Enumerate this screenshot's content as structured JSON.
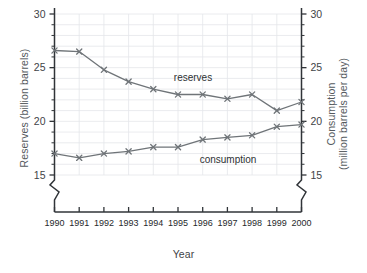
{
  "chart_data": {
    "type": "line",
    "title": "",
    "xlabel": "Year",
    "ylabel": "Reserves (billion barrels)",
    "ylabel_right_line1": "Consumption",
    "ylabel_right_line2": "(million barrels per day)",
    "categories": [
      "1990",
      "1991",
      "1992",
      "1993",
      "1994",
      "1995",
      "1996",
      "1997",
      "1998",
      "1999",
      "2000"
    ],
    "x": [
      1990,
      1991,
      1992,
      1993,
      1994,
      1995,
      1996,
      1997,
      1998,
      1999,
      2000
    ],
    "ylim": [
      15,
      30
    ],
    "ylim_right": [
      15,
      30
    ],
    "yticks": [
      15,
      20,
      25,
      30
    ],
    "yticks_right": [
      15,
      20,
      25,
      30
    ],
    "ytick_labels": [
      "15",
      "20",
      "25",
      "30"
    ],
    "ytick_labels_right": [
      "15",
      "20",
      "25",
      "30"
    ],
    "minor_tick_step": 1,
    "axis_break": true,
    "grid": true,
    "legend": "inline-annotations",
    "series": [
      {
        "name": "reserves",
        "axis": "left",
        "units": "billion barrels",
        "color": "#6f7478",
        "marker": "x",
        "label_text": "reserves",
        "values": [
          26.6,
          26.5,
          24.8,
          23.7,
          23.0,
          22.5,
          22.5,
          22.1,
          22.5,
          21.0,
          21.8
        ]
      },
      {
        "name": "consumption",
        "axis": "right",
        "units": "million barrels per day",
        "color": "#6f7478",
        "marker": "x",
        "label_text": "consumption",
        "values": [
          17.0,
          16.6,
          17.0,
          17.2,
          17.6,
          17.6,
          18.3,
          18.5,
          18.7,
          19.5,
          19.7
        ]
      }
    ]
  },
  "colors": {
    "axis": "#303438",
    "grid": "#e4e6ea",
    "series": "#6f7478",
    "text": "#3f4447",
    "axis_title": "#555a5e",
    "background": "#ffffff"
  }
}
